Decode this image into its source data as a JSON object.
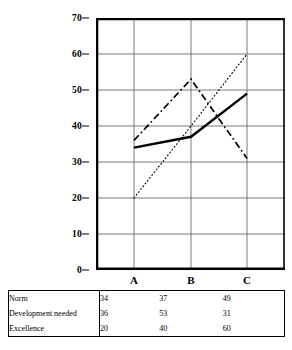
{
  "chart_data": {
    "type": "line",
    "title": "",
    "xlabel": "",
    "ylabel": "",
    "categories": [
      "A",
      "B",
      "C"
    ],
    "ylim": [
      0,
      70
    ],
    "yticks": [
      0,
      10,
      20,
      30,
      40,
      50,
      60,
      70
    ],
    "ytick_labels": [
      "0",
      "10",
      "20",
      "30",
      "40",
      "50",
      "60",
      "70"
    ],
    "grid": true,
    "legend": "none",
    "series": [
      {
        "name": "Norm",
        "values": [
          34,
          37,
          49
        ],
        "style": "solid",
        "color": "#000000"
      },
      {
        "name": "Development needed",
        "values": [
          36,
          53,
          31
        ],
        "style": "dash-dot",
        "color": "#000000"
      },
      {
        "name": "Excellence",
        "values": [
          20,
          40,
          60
        ],
        "style": "dotted",
        "color": "#000000"
      }
    ]
  },
  "table": {
    "column_headers": [
      "A",
      "B",
      "C"
    ],
    "rows": [
      {
        "label": "Norm",
        "a": "34",
        "b": "37",
        "c": "49"
      },
      {
        "label": "Development needed",
        "a": "36",
        "b": "53",
        "c": "31"
      },
      {
        "label": "Excellence",
        "a": "20",
        "b": "40",
        "c": "60"
      }
    ]
  },
  "axis": {
    "y_labels": [
      "70",
      "60",
      "50",
      "40",
      "30",
      "20",
      "10",
      "0"
    ],
    "x_labels": [
      "A",
      "B",
      "C"
    ]
  },
  "colors": {
    "axis": "#000000",
    "gridline": "#6b6b6b",
    "background": "#ffffff"
  }
}
